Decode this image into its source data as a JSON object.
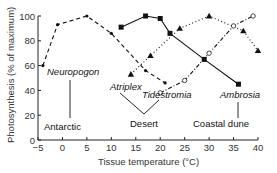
{
  "chart_data": {
    "type": "line",
    "title": "",
    "xlabel": "Tissue temperature (°C)",
    "ylabel": "Photosynthesis (% of maximum)",
    "xlim": [
      -5,
      40
    ],
    "ylim": [
      0,
      100
    ],
    "xticks": [
      -5,
      0,
      5,
      10,
      15,
      20,
      25,
      30,
      35,
      40
    ],
    "yticks": [
      0,
      20,
      40,
      60,
      80,
      100
    ],
    "grid": false,
    "series": [
      {
        "name": "Neuropogon",
        "habitat": "Antarctic",
        "marker": "small-dot",
        "line": "dashed",
        "x": [
          -4,
          -1,
          5,
          10,
          17,
          21
        ],
        "y": [
          60,
          93,
          100,
          86,
          56,
          46
        ]
      },
      {
        "name": "Atriplex",
        "habitat": "Desert",
        "marker": "filled-triangle",
        "line": "dotted",
        "x": [
          14,
          18,
          24,
          30,
          37,
          40
        ],
        "y": [
          53,
          68,
          90,
          100,
          88,
          72
        ]
      },
      {
        "name": "Tidestromia",
        "habitat": "Desert",
        "marker": "open-circle",
        "line": "dash-dot",
        "x": [
          20,
          25,
          30,
          35,
          39
        ],
        "y": [
          38,
          48,
          70,
          92,
          100
        ]
      },
      {
        "name": "Ambrosia",
        "habitat": "Coastal dune",
        "marker": "filled-square",
        "line": "solid",
        "x": [
          12,
          17,
          20,
          22,
          29,
          36
        ],
        "y": [
          91,
          100,
          98,
          86,
          65,
          45
        ]
      }
    ],
    "annotations": [
      {
        "text": "Neuropogon",
        "italic": true
      },
      {
        "text": "Antarctic",
        "italic": false
      },
      {
        "text": "Atriplex",
        "italic": true
      },
      {
        "text": "Tidestromia",
        "italic": true
      },
      {
        "text": "Desert",
        "italic": false
      },
      {
        "text": "Ambrosia",
        "italic": true
      },
      {
        "text": "Coastal dune",
        "italic": false
      }
    ]
  }
}
